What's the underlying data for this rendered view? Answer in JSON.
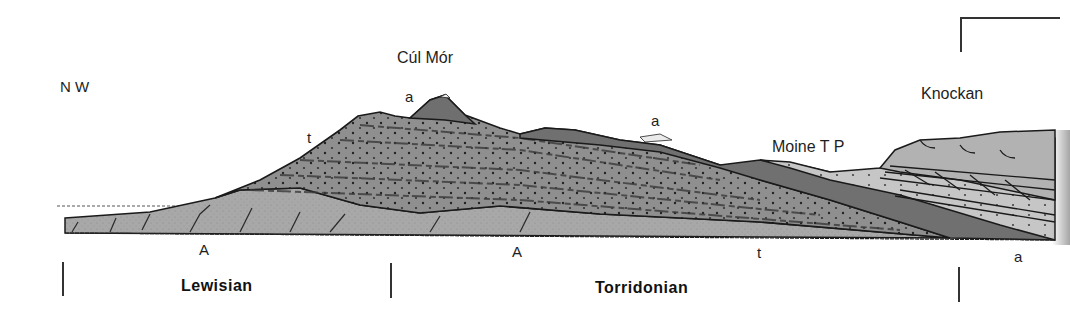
{
  "diagram": {
    "type": "geological cross-section",
    "orientation_label": "N W",
    "peaks": {
      "cul_mor": "Cúl Mór",
      "knockan": "Knockan"
    },
    "features": {
      "moine_thrust": "Moine T P"
    },
    "rock_symbols": {
      "a_summit": "a",
      "a_ridge": "a",
      "t_slope": "t",
      "A_left": "A",
      "A_center": "A",
      "t_base": "t",
      "a_right": "a"
    },
    "units": [
      {
        "name": "Lewisian"
      },
      {
        "name": "Torridonian"
      }
    ],
    "colors": {
      "lewisian_gneiss": "#a9a9a9",
      "torridonian_sandstone": "#8c8c8c",
      "cambrian_quartzite": "#6e6e6e",
      "moine_schist": "#c4c4c4",
      "outline": "#1a1a1a"
    }
  }
}
